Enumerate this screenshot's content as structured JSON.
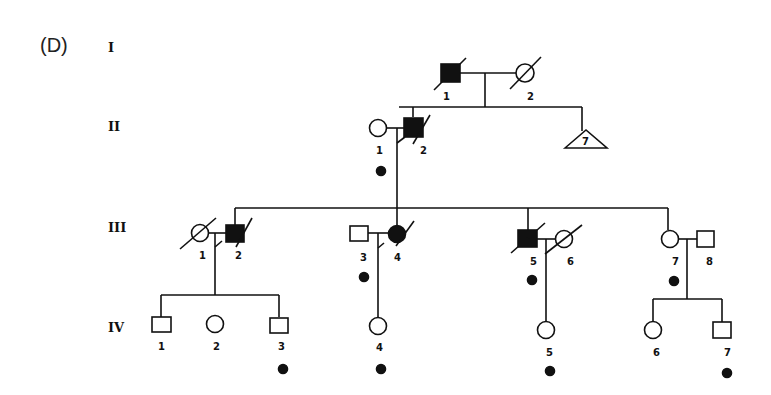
{
  "panel_label": "(D)",
  "generations": [
    {
      "label": "I",
      "y": 47
    },
    {
      "label": "II",
      "y": 126
    },
    {
      "label": "III",
      "y": 227
    },
    {
      "label": "IV",
      "y": 328
    }
  ],
  "individuals": {
    "I_1": {
      "label": "1",
      "sex": "male",
      "affected": true,
      "deceased": true
    },
    "I_2": {
      "label": "2",
      "sex": "female",
      "affected": false,
      "deceased": true
    },
    "II_1": {
      "label": "1",
      "sex": "female",
      "affected": false,
      "deceased": false,
      "marker": true
    },
    "II_2": {
      "label": "2",
      "sex": "male",
      "affected": true,
      "deceased": true
    },
    "II_sibs": {
      "label": "7",
      "shape": "triangle"
    },
    "III_1": {
      "label": "1",
      "sex": "female",
      "affected": false,
      "deceased": true
    },
    "III_2": {
      "label": "2",
      "sex": "male",
      "affected": true,
      "deceased": true
    },
    "III_3": {
      "label": "3",
      "sex": "male",
      "affected": false,
      "deceased": false,
      "marker": true
    },
    "III_4": {
      "label": "4",
      "sex": "female",
      "affected": true,
      "deceased": true
    },
    "III_5": {
      "label": "5",
      "sex": "male",
      "affected": true,
      "deceased": true,
      "marker": true
    },
    "III_6": {
      "label": "6",
      "sex": "female",
      "affected": false,
      "deceased": true
    },
    "III_7": {
      "label": "7",
      "sex": "female",
      "affected": false,
      "deceased": false,
      "marker": true
    },
    "III_8": {
      "label": "8",
      "sex": "male",
      "affected": false,
      "deceased": false
    },
    "IV_1": {
      "label": "1",
      "sex": "male",
      "affected": false
    },
    "IV_2": {
      "label": "2",
      "sex": "female",
      "affected": false
    },
    "IV_3": {
      "label": "3",
      "sex": "male",
      "affected": false,
      "marker": true
    },
    "IV_4": {
      "label": "4",
      "sex": "female",
      "affected": false,
      "marker": true
    },
    "IV_5": {
      "label": "5",
      "sex": "female",
      "affected": false,
      "marker": true
    },
    "IV_6": {
      "label": "6",
      "sex": "female",
      "affected": false
    },
    "IV_7": {
      "label": "7",
      "sex": "male",
      "affected": false,
      "marker": true
    }
  }
}
